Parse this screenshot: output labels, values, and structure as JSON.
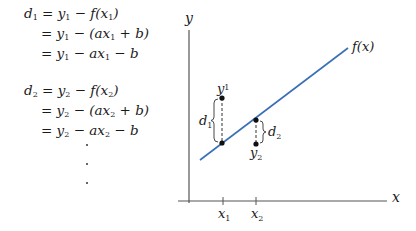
{
  "equations": {
    "block1": [
      {
        "lhs": "d",
        "lhs_sub": "1",
        "parts": [
          "y",
          "1",
          " − f(x",
          "1",
          ")"
        ]
      },
      {
        "parts": [
          "y",
          "1",
          " − (ax",
          "1",
          " + b)"
        ]
      },
      {
        "parts": [
          "y",
          "1",
          " − ax",
          "1",
          " − b"
        ]
      }
    ],
    "block2": [
      {
        "lhs": "d",
        "lhs_sub": "2",
        "parts": [
          "y",
          "2",
          " − f(x",
          "2",
          ")"
        ]
      },
      {
        "parts": [
          "y",
          "2",
          " − (ax",
          "2",
          " + b)"
        ]
      },
      {
        "parts": [
          "y",
          "2",
          " − ax",
          "2",
          " − b"
        ]
      }
    ],
    "equals": "=",
    "continuation": "⋮"
  },
  "plot": {
    "y_axis_label": "y",
    "x_axis_label": "x",
    "line_label": "f(x)",
    "line_color": "#3a6fb5",
    "axis_color": "#555555",
    "ticks": [
      {
        "label": "x",
        "sub": "1"
      },
      {
        "label": "x",
        "sub": "2"
      }
    ],
    "points": [
      {
        "label": "y",
        "sub": "1",
        "distance_label": "d",
        "distance_sub": "1",
        "position": "above line"
      },
      {
        "label": "y",
        "sub": "2",
        "distance_label": "d",
        "distance_sub": "2",
        "position": "below line"
      }
    ]
  }
}
